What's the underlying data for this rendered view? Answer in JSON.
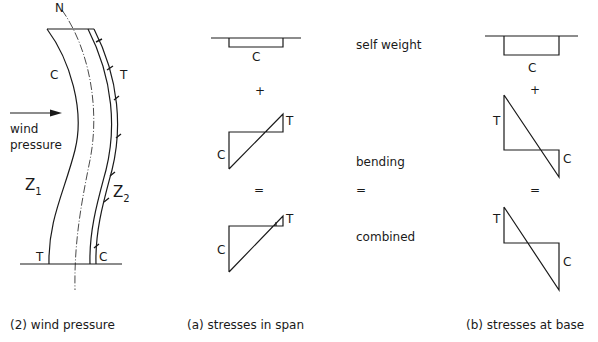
{
  "figure": {
    "column": {
      "neutral_axis_label": "N",
      "compression_side_label": "C",
      "tension_side_label": "T",
      "load_label_line1": "wind",
      "load_label_line2": "pressure",
      "zone1_label": "Z",
      "zone1_sub": "1",
      "zone2_label": "Z",
      "zone2_sub": "2",
      "base_left_label": "T",
      "base_right_label": "C",
      "caption": "(2) wind  pressure"
    },
    "row_labels": {
      "self_weight": "self weight",
      "plus": "+",
      "bending": "bending",
      "equals": "=",
      "combined": "combined"
    },
    "span_stresses": {
      "caption": "(a) stresses  in span",
      "self_weight_label": "C",
      "plus": "+",
      "bending_c": "C",
      "bending_t": "T",
      "equals": "=",
      "combined_c": "C",
      "combined_t": "T"
    },
    "base_stresses": {
      "caption": "(b) stresses  at base",
      "self_weight_label": "C",
      "plus": "+",
      "bending_t": "T",
      "bending_c": "C",
      "equals": "=",
      "combined_t": "T",
      "combined_c": "C"
    },
    "colors": {
      "line": "#1a1a1a",
      "background": "#ffffff"
    }
  }
}
